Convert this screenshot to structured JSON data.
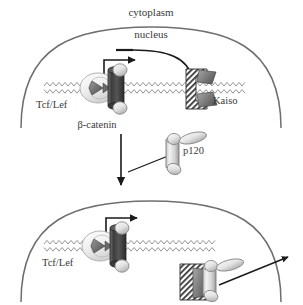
{
  "figure": {
    "type": "biological-pathway-diagram",
    "panels": [
      {
        "id": "top-panel",
        "name": "panel-without-p120",
        "compartments": [
          {
            "name": "cytoplasm",
            "label": "cytoplasm"
          },
          {
            "name": "nucleus",
            "label": "nucleus"
          }
        ],
        "complexes": [
          {
            "name": "tcf-lef-beta-catenin-complex",
            "labels": [
              "Tcf/Lef",
              "β-catenin"
            ],
            "bound_to": "DNA",
            "activity": "transcription-on"
          },
          {
            "name": "kaiso-complex",
            "labels": [
              "Kaiso"
            ],
            "bound_to": "DNA",
            "activity": "repression"
          }
        ],
        "interactions": [
          {
            "name": "transcription-arrow",
            "kind": "arrow",
            "meaning": "transcription"
          },
          {
            "name": "kaiso-inhibition-arrow",
            "kind": "inhibition-bar",
            "meaning": "Kaiso represses transcription"
          }
        ]
      },
      {
        "id": "middle-panel",
        "name": "panel-p120-entry",
        "complexes": [
          {
            "name": "p120-molecule",
            "labels": [
              "p120"
            ],
            "bound_to": "none",
            "activity": "free"
          }
        ],
        "interactions": [
          {
            "name": "p120-entry-arrow",
            "kind": "arrow",
            "meaning": "p120 enters nucleus"
          }
        ]
      },
      {
        "id": "bottom-panel",
        "name": "panel-with-p120",
        "complexes": [
          {
            "name": "tcf-lef-beta-catenin-complex",
            "labels": [
              "Tcf/Lef"
            ],
            "bound_to": "DNA",
            "activity": "transcription-on"
          },
          {
            "name": "kaiso-p120-complex",
            "labels": [],
            "bound_to": "none",
            "activity": "released-from-DNA"
          }
        ],
        "interactions": [
          {
            "name": "transcription-arrow",
            "kind": "arrow",
            "meaning": "transcription"
          },
          {
            "name": "kaiso-release-arrow",
            "kind": "arrow",
            "meaning": "Kaiso-p120 leaves nucleus"
          }
        ]
      }
    ],
    "labels": {
      "cytoplasm": "cytoplasm",
      "nucleus": "nucleus",
      "tcf_lef_top": "Tcf/Lef",
      "beta_catenin": "β-catenin",
      "kaiso": "Kaiso",
      "p120": "p120",
      "tcf_lef_bottom": "Tcf/Lef"
    },
    "colors": {
      "background": "#ffffff",
      "outline": "#6f6f6f",
      "text": "#3a3a3a",
      "dna": "#8c8c8c",
      "arrow": "#1a1a1a",
      "protein_dark": "#4a4a4a",
      "protein_mid": "#8f8f8f",
      "protein_light": "#e8e8e8",
      "hatch": "#2e2e2e"
    }
  }
}
